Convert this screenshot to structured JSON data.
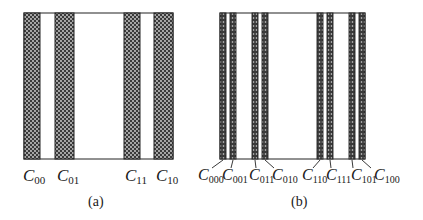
{
  "figure": {
    "panels": [
      {
        "id": "a",
        "caption": "(a)",
        "box": {
          "x": 24,
          "y": 13,
          "w": 149,
          "h": 146
        },
        "stripes": [
          {
            "label": "C",
            "sub": "00",
            "x": 24,
            "w": 16,
            "label_x": 22
          },
          {
            "label": "C",
            "sub": "01",
            "x": 55,
            "w": 19,
            "label_x": 57
          },
          {
            "label": "C",
            "sub": "11",
            "x": 124,
            "w": 16,
            "label_x": 125
          },
          {
            "label": "C",
            "sub": "10",
            "x": 154,
            "w": 19,
            "label_x": 157
          }
        ]
      },
      {
        "id": "b",
        "caption": "(b)",
        "box": {
          "x": 220,
          "y": 13,
          "w": 145,
          "h": 146
        },
        "stripes": [
          {
            "label": "C",
            "sub": "000",
            "x": 220,
            "w": 6
          },
          {
            "label": "C",
            "sub": "001",
            "x": 230,
            "w": 6
          },
          {
            "label": "C",
            "sub": "011",
            "x": 252,
            "w": 6
          },
          {
            "label": "C",
            "sub": "010",
            "x": 262,
            "w": 6
          },
          {
            "label": "C",
            "sub": "110",
            "x": 317,
            "w": 6
          },
          {
            "label": "C",
            "sub": "111",
            "x": 327,
            "w": 6
          },
          {
            "label": "C",
            "sub": "101",
            "x": 349,
            "w": 6
          },
          {
            "label": "C",
            "sub": "100",
            "x": 359,
            "w": 6
          }
        ]
      }
    ],
    "colors": {
      "stripe_fill": "#3a3a3a",
      "stripe_dot": "#d8d8d8",
      "outline": "#222222",
      "text": "#1a1a1a"
    }
  },
  "labels": {
    "a": {
      "c00_main": "C",
      "c00_sub": "00",
      "c01_main": "C",
      "c01_sub": "01",
      "c11_main": "C",
      "c11_sub": "11",
      "c10_main": "C",
      "c10_sub": "10"
    },
    "b": {
      "c000_main": "C",
      "c000_sub": "000",
      "c001_main": "C",
      "c001_sub": "001",
      "c011_main": "C",
      "c011_sub": "011",
      "c010_main": "C",
      "c010_sub": "010",
      "c110_main": "C",
      "c110_sub": "110",
      "c111_main": "C",
      "c111_sub": "111",
      "c101_main": "C",
      "c101_sub": "101",
      "c100_main": "C",
      "c100_sub": "100"
    },
    "caption_a": "(a)",
    "caption_b": "(b)"
  }
}
